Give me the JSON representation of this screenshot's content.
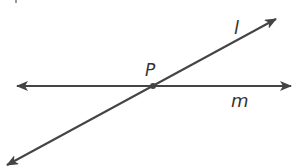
{
  "diagram": {
    "type": "intersecting-lines",
    "colors": {
      "line": "#444444",
      "text": "#333333",
      "background": "#ffffff"
    },
    "lines": [
      {
        "name": "l",
        "label": "l",
        "from": [
          7,
          165
        ],
        "to": [
          276,
          19
        ]
      },
      {
        "name": "m",
        "label": "m",
        "from": [
          17,
          86
        ],
        "to": [
          291,
          86
        ]
      }
    ],
    "points": [
      {
        "name": "P",
        "label": "P",
        "at": [
          153,
          86
        ]
      }
    ]
  }
}
